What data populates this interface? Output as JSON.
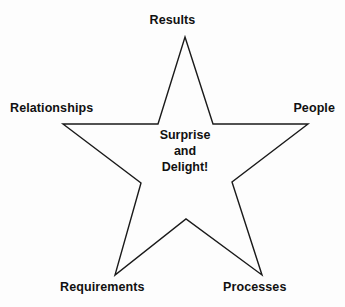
{
  "diagram": {
    "type": "five-point-star",
    "background_color": "#fdfdfd",
    "outline_color": "#1a1a1a",
    "text_color": "#111111",
    "center": {
      "lines": [
        "Surprise",
        "and",
        "Delight!"
      ]
    },
    "points": [
      {
        "id": "results",
        "label": "Results",
        "position": "top"
      },
      {
        "id": "people",
        "label": "People",
        "position": "right"
      },
      {
        "id": "processes",
        "label": "Processes",
        "position": "bottom-right"
      },
      {
        "id": "requirements",
        "label": "Requirements",
        "position": "bottom-left"
      },
      {
        "id": "relationships",
        "label": "Relationships",
        "position": "left"
      }
    ],
    "geometry": {
      "outer_vertices": [
        {
          "x": 185,
          "y": 37
        },
        {
          "x": 308,
          "y": 124
        },
        {
          "x": 262,
          "y": 275
        },
        {
          "x": 115,
          "y": 275
        },
        {
          "x": 63,
          "y": 124
        }
      ],
      "inner_vertices": [
        {
          "x": 213,
          "y": 124
        },
        {
          "x": 232,
          "y": 182
        },
        {
          "x": 186,
          "y": 219
        },
        {
          "x": 141,
          "y": 183
        },
        {
          "x": 158,
          "y": 124
        }
      ],
      "path": "M 185,37 L 213,124 L 308,124 L 232,182 L 262,275 L 186,219 L 115,275 L 141,183 L 63,124 L 158,124 Z"
    }
  }
}
